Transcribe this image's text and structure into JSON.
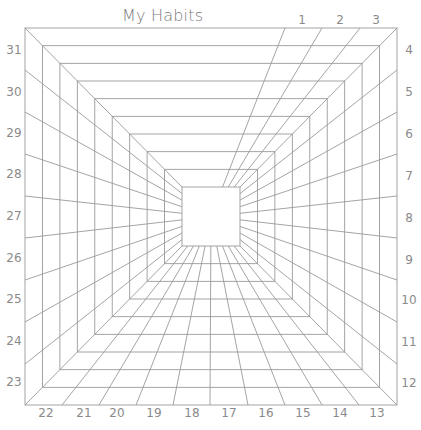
{
  "title": "My Habits",
  "colors": {
    "line": "#9a9a9a",
    "label": "#8a8a8a",
    "title": "#7a7a7a",
    "background": "#ffffff"
  },
  "geometry": {
    "outer": {
      "x1": 25,
      "y1": 28,
      "x2": 397,
      "y2": 405
    },
    "inner": {
      "x1": 182,
      "y1": 187,
      "x2": 240,
      "y2": 246
    },
    "ring_count": 10
  },
  "spokes": {
    "top": [
      285,
      322,
      360
    ],
    "right": [
      70,
      112,
      154,
      196,
      238,
      280,
      322,
      364
    ],
    "bottom": [
      62,
      99,
      136,
      173,
      210,
      248,
      285,
      322,
      359
    ],
    "left": [
      70,
      112,
      154,
      196,
      238,
      280,
      322,
      364
    ]
  },
  "days": [
    {
      "label": "1",
      "x": 302,
      "y": 20
    },
    {
      "label": "2",
      "x": 340,
      "y": 20
    },
    {
      "label": "3",
      "x": 376,
      "y": 20
    },
    {
      "label": "4",
      "x": 409,
      "y": 50
    },
    {
      "label": "5",
      "x": 409,
      "y": 92
    },
    {
      "label": "6",
      "x": 409,
      "y": 134
    },
    {
      "label": "7",
      "x": 409,
      "y": 176
    },
    {
      "label": "8",
      "x": 409,
      "y": 218
    },
    {
      "label": "9",
      "x": 409,
      "y": 260
    },
    {
      "label": "10",
      "x": 409,
      "y": 300
    },
    {
      "label": "11",
      "x": 409,
      "y": 342
    },
    {
      "label": "12",
      "x": 409,
      "y": 383
    },
    {
      "label": "13",
      "x": 377,
      "y": 413
    },
    {
      "label": "14",
      "x": 340,
      "y": 413
    },
    {
      "label": "15",
      "x": 303,
      "y": 413
    },
    {
      "label": "16",
      "x": 266,
      "y": 413
    },
    {
      "label": "17",
      "x": 229,
      "y": 413
    },
    {
      "label": "18",
      "x": 192,
      "y": 413
    },
    {
      "label": "19",
      "x": 154,
      "y": 413
    },
    {
      "label": "20",
      "x": 117,
      "y": 413
    },
    {
      "label": "21",
      "x": 84,
      "y": 413
    },
    {
      "label": "22",
      "x": 46,
      "y": 413
    },
    {
      "label": "23",
      "x": 14,
      "y": 382
    },
    {
      "label": "24",
      "x": 14,
      "y": 341
    },
    {
      "label": "25",
      "x": 14,
      "y": 299
    },
    {
      "label": "26",
      "x": 14,
      "y": 258
    },
    {
      "label": "27",
      "x": 14,
      "y": 216
    },
    {
      "label": "28",
      "x": 14,
      "y": 174
    },
    {
      "label": "29",
      "x": 14,
      "y": 133
    },
    {
      "label": "30",
      "x": 14,
      "y": 92
    },
    {
      "label": "31",
      "x": 14,
      "y": 50
    }
  ]
}
